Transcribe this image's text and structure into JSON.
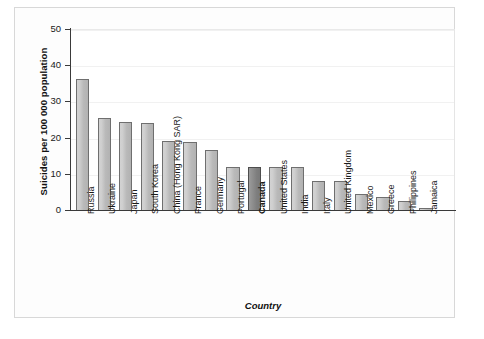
{
  "chart_data": {
    "type": "bar",
    "title": "",
    "xlabel": "Country",
    "ylabel": "Suicides per 100 000 population",
    "ylim": [
      0,
      50
    ],
    "yticks": [
      0,
      10,
      20,
      30,
      40,
      50
    ],
    "grid": true,
    "legend": null,
    "highlight_category": "Canada",
    "categories": [
      "Russia",
      "Ukraine",
      "Japan",
      "South Korea",
      "China (Hong Kong SAR)",
      "France",
      "Germany",
      "Portugal",
      "Canada",
      "United States",
      "India",
      "Italy",
      "United Kingdom",
      "Mexico",
      "Greece",
      "Philippines",
      "Jamaica"
    ],
    "values": [
      36.2,
      25.3,
      24.3,
      24.0,
      19.0,
      18.8,
      16.7,
      12.0,
      11.9,
      11.8,
      11.8,
      8.0,
      7.9,
      4.5,
      3.6,
      2.6,
      0.5
    ]
  },
  "colors": {
    "bar_fill": "#c8c8c8",
    "bar_edge": "#6f6f6f",
    "highlight_fill": "#888888",
    "highlight_edge": "#4d4d4d",
    "axis": "#3a3a3a",
    "grid": "#f1f1f1",
    "frame": "#d8d8d8",
    "background": "#ffffff"
  }
}
